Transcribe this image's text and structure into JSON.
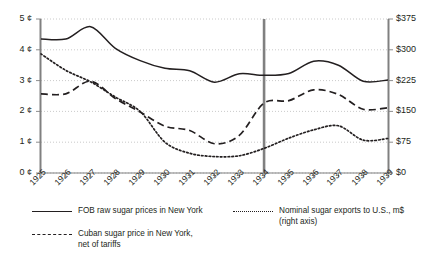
{
  "chart_data": {
    "type": "line",
    "title": "",
    "xlabel": "",
    "ylabel": "",
    "grid": true,
    "legend_position": "bottom",
    "categories": [
      "1925",
      "1926",
      "1927",
      "1928",
      "1929",
      "1930",
      "1931",
      "1932",
      "1933",
      "1934",
      "1935",
      "1936",
      "1937",
      "1938",
      "1939"
    ],
    "left_axis": {
      "label": "",
      "ylim": [
        0,
        5
      ],
      "ticks": [
        0,
        1,
        2,
        3,
        4,
        5
      ],
      "tick_labels": [
        "0 ¢",
        "1 ¢",
        "2 ¢",
        "3 ¢",
        "4 ¢",
        "5 ¢"
      ],
      "unit": "cents"
    },
    "right_axis": {
      "label": "",
      "ylim": [
        0,
        375
      ],
      "ticks": [
        0,
        75,
        150,
        225,
        300,
        375
      ],
      "tick_labels": [
        "$0",
        "$75",
        "$150",
        "$225",
        "$300",
        "$375"
      ],
      "unit": "million dollars"
    },
    "series": [
      {
        "name": "FOB raw sugar prices in New York",
        "style": "solid",
        "axis": "left",
        "color": "#231f20",
        "values": [
          4.35,
          4.35,
          4.75,
          4.05,
          3.65,
          3.4,
          3.32,
          2.95,
          3.22,
          3.17,
          3.23,
          3.63,
          3.5,
          2.98,
          3.02
        ]
      },
      {
        "name": "Cuban sugar price in New York, net of tariffs",
        "style": "dashed",
        "axis": "left",
        "color": "#231f20",
        "values": [
          2.57,
          2.57,
          2.98,
          2.42,
          1.98,
          1.52,
          1.38,
          0.95,
          1.22,
          2.27,
          2.35,
          2.7,
          2.55,
          2.07,
          2.12
        ]
      },
      {
        "name": "Nominal sugar exports to U.S., m$",
        "style": "dotted",
        "axis": "right",
        "color": "#231f20",
        "values": [
          290,
          250,
          222,
          185,
          150,
          75,
          48,
          40,
          42,
          60,
          85,
          105,
          115,
          80,
          84
        ]
      }
    ],
    "annotations": [
      {
        "type": "vertical-line",
        "x": "1934",
        "color": "#808080",
        "label": ""
      }
    ]
  },
  "axes": {
    "left_ticks": [
      "5 ¢",
      "4 ¢",
      "3 ¢",
      "2 ¢",
      "1 ¢",
      "0 ¢"
    ],
    "right_ticks": [
      "$375",
      "$300",
      "$225",
      "$150",
      "$75",
      "$0"
    ],
    "x_ticks": [
      "1925",
      "1926",
      "1927",
      "1928",
      "1929",
      "1930",
      "1931",
      "1932",
      "1933",
      "1934",
      "1935",
      "1936",
      "1937",
      "1938",
      "1939"
    ]
  },
  "legend": {
    "items": [
      {
        "label": "FOB raw sugar prices in New York",
        "label2": "",
        "style": "solid"
      },
      {
        "label": "Cuban sugar price in New York,",
        "label2": "net of tariffs",
        "style": "dashed"
      },
      {
        "label": "Nominal sugar exports to U.S., m$",
        "label2": "(right axis)",
        "style": "dotted"
      }
    ]
  },
  "colors": {
    "ink": "#231f20",
    "axis": "#808080",
    "grid": "#bcbcbc",
    "marker": "#808080",
    "background": "#ffffff"
  }
}
